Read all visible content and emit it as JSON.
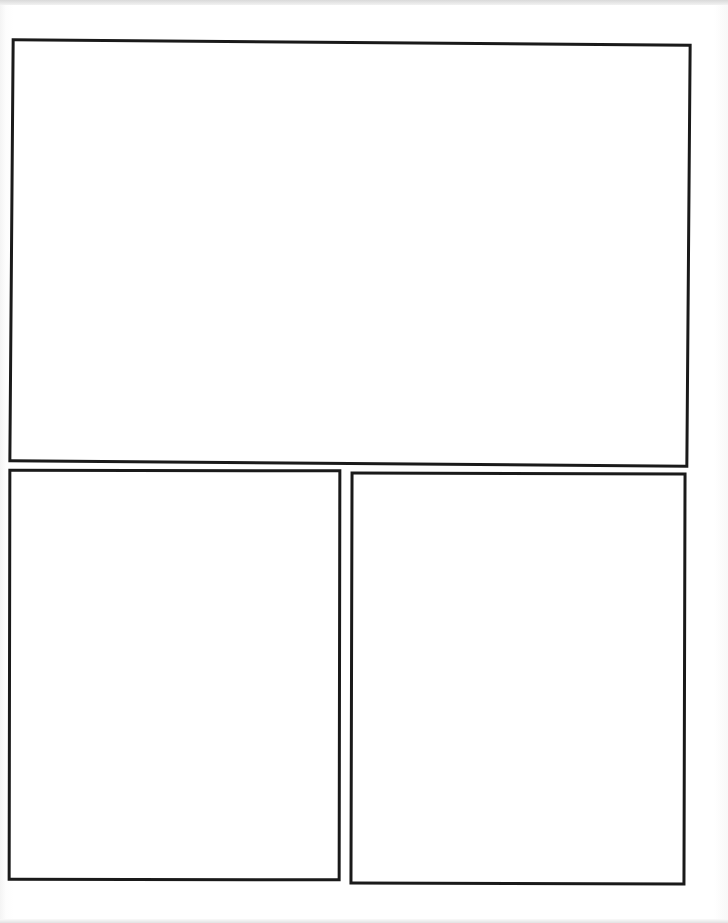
{
  "page": {
    "type": "comic-panel-template",
    "background_color": "#ffffff",
    "border_color": "#1a1a1a"
  },
  "panels": [
    {
      "id": "top",
      "label": ""
    },
    {
      "id": "bottom-left",
      "label": ""
    },
    {
      "id": "bottom-right",
      "label": ""
    }
  ]
}
